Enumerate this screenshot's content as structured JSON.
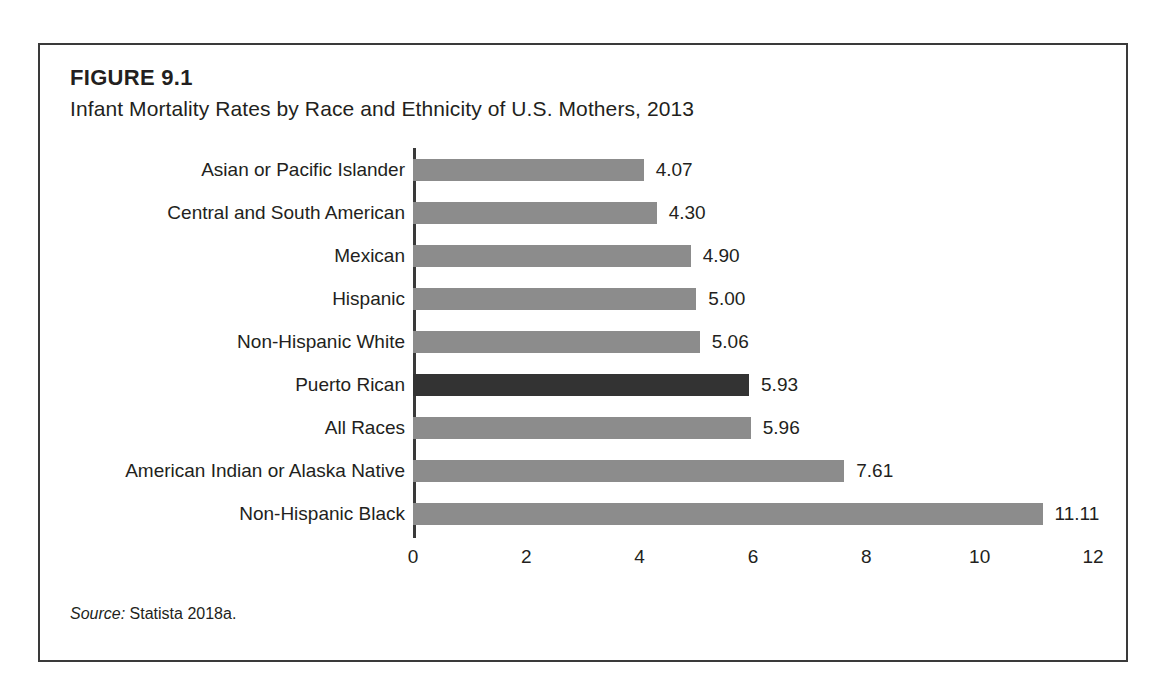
{
  "figure": {
    "number": "FIGURE 9.1",
    "title": "Infant Mortality Rates by Race and Ethnicity of U.S. Mothers, 2013",
    "source_label": "Source:",
    "source_text": "Statista 2018a."
  },
  "colors": {
    "bar": "#8c8c8c",
    "bar_highlight": "#333333",
    "axis": "#3a3a3a",
    "text": "#231f20",
    "frame": "#3a3a3a",
    "background": "#ffffff"
  },
  "chart_data": {
    "type": "bar",
    "orientation": "horizontal",
    "title": "Infant Mortality Rates by Race and Ethnicity of U.S. Mothers, 2013",
    "xlabel": "",
    "ylabel": "",
    "xlim": [
      0,
      12
    ],
    "grid": false,
    "legend": null,
    "xticks": [
      "0",
      "2",
      "4",
      "6",
      "8",
      "10",
      "12"
    ],
    "xtick_values": [
      0,
      2,
      4,
      6,
      8,
      10,
      12
    ],
    "categories": [
      "Asian or Pacific Islander",
      "Central and South American",
      "Mexican",
      "Hispanic",
      "Non-Hispanic White",
      "Puerto Rican",
      "All Races",
      "American Indian or Alaska Native",
      "Non-Hispanic Black"
    ],
    "values": [
      4.07,
      4.3,
      4.9,
      5.0,
      5.06,
      5.93,
      5.96,
      7.61,
      11.11
    ],
    "value_labels": [
      "4.07",
      "4.30",
      "4.90",
      "5.00",
      "5.06",
      "5.93",
      "5.96",
      "7.61",
      "11.11"
    ],
    "highlighted": [
      "Puerto Rican"
    ],
    "bars": [
      {
        "category": "Asian or Pacific Islander",
        "value": 4.07,
        "label": "4.07",
        "highlight": false
      },
      {
        "category": "Central and South American",
        "value": 4.3,
        "label": "4.30",
        "highlight": false
      },
      {
        "category": "Mexican",
        "value": 4.9,
        "label": "4.90",
        "highlight": false
      },
      {
        "category": "Hispanic",
        "value": 5.0,
        "label": "5.00",
        "highlight": false
      },
      {
        "category": "Non-Hispanic White",
        "value": 5.06,
        "label": "5.06",
        "highlight": false
      },
      {
        "category": "Puerto Rican",
        "value": 5.93,
        "label": "5.93",
        "highlight": true
      },
      {
        "category": "All Races",
        "value": 5.96,
        "label": "5.96",
        "highlight": false
      },
      {
        "category": "American Indian or Alaska Native",
        "value": 7.61,
        "label": "7.61",
        "highlight": false
      },
      {
        "category": "Non-Hispanic Black",
        "value": 11.11,
        "label": "11.11",
        "highlight": false
      }
    ]
  }
}
